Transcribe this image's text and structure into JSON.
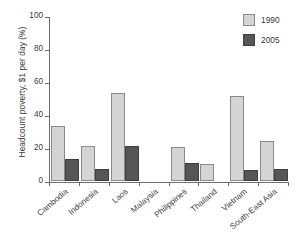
{
  "chart_data": {
    "type": "bar",
    "title": "",
    "xlabel": "",
    "ylabel": "Headcount poverty, $1 per day (%)",
    "ylim": [
      0,
      100
    ],
    "yticks": [
      0,
      20,
      40,
      60,
      80,
      100
    ],
    "grid": false,
    "legend_position": "top-right",
    "categories": [
      "Cambodia",
      "Indonesia",
      "Laos",
      "Malaysia",
      "Philippines",
      "Thailand",
      "Vietnam",
      "South-East Asia"
    ],
    "series": [
      {
        "name": "1990",
        "color": "#d4d4d4",
        "values": [
          33.5,
          21.0,
          53.5,
          0.0,
          20.8,
          10.5,
          51.5,
          24.3
        ]
      },
      {
        "name": "2005",
        "color": "#565656",
        "values": [
          13.2,
          7.4,
          21.4,
          0.0,
          11.2,
          0.0,
          6.4,
          7.0
        ]
      }
    ]
  },
  "legend": {
    "entries": [
      {
        "label": "1990",
        "swatch": "legend-swatch-1990"
      },
      {
        "label": "2005",
        "swatch": "legend-swatch-2005"
      }
    ]
  }
}
